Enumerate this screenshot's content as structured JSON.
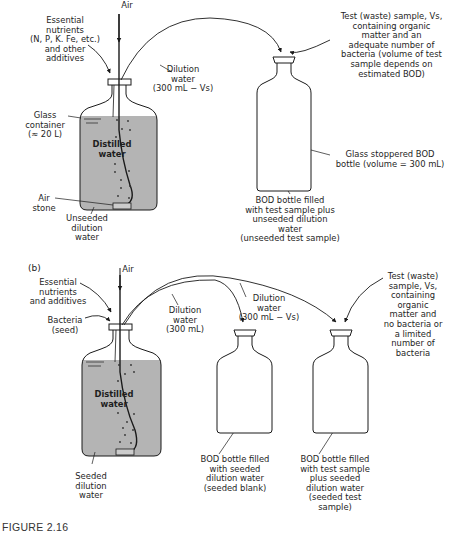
{
  "figure": {
    "caption": "FIGURE 2.16",
    "colors": {
      "liquid_fill": "#b4b4b4",
      "line": "#1a1a1a",
      "background": "#ffffff"
    }
  },
  "panel_a": {
    "label": "(a)",
    "air": "Air",
    "nutrients": "Essential\nnutrients\n(N, P, K. Fe, etc.)\nand other\nadditives",
    "dilution_water": "Dilution\nwater\n(300 mL − Vs)",
    "test_sample": "Test (waste) sample, Vs,\ncontaining organic\nmatter and an\nadequate number of\nbacteria (volume of test\nsample depends on\nestimated BOD)",
    "glass_container": "Glass\ncontainer\n(≈ 20 L)",
    "distilled_water": "Distilled\nwater",
    "air_stone": "Air\nstone",
    "unseeded_dilution": "Unseeded\ndilution\nwater",
    "bod_bottle_desc": "Glass stoppered BOD\nbottle (volume = 300 mL)",
    "bod_bottle_fill": "BOD bottle filled\nwith test sample plus\nunseeded dilution water\n(unseeded test sample)"
  },
  "panel_b": {
    "label": "(b)",
    "air": "Air",
    "nutrients": "Essential\nnutrients\nand additives",
    "bacteria": "Bacteria\n(seed)",
    "dilution_water_1": "Dilution\nwater\n(300 mL)",
    "dilution_water_2": "Dilution\nwater\n(300 mL − Vs)",
    "test_sample": "Test (waste)\nsample, Vs,\ncontaining\norganic\nmatter and\nno bacteria or\na limited\nnumber of\nbacteria",
    "distilled_water": "Distilled\nwater",
    "seeded_dilution": "Seeded\ndilution\nwater",
    "seeded_blank": "BOD bottle filled\nwith seeded\ndilution water\n(seeded blank)",
    "seeded_test": "BOD bottle filled\nwith test sample\nplus seeded\ndilution water\n(seeded test\nsample)"
  }
}
